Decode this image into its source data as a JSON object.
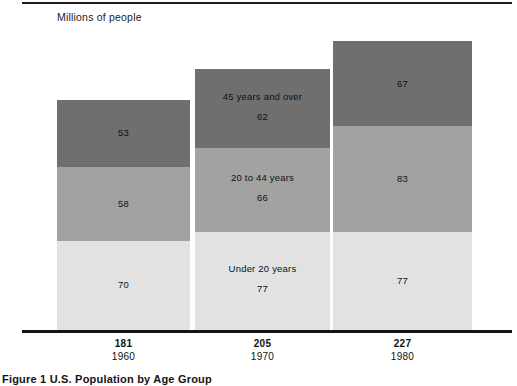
{
  "figure": {
    "units_label": "Millions of people",
    "caption": "Figure 1 U.S. Population by Age Group"
  },
  "chart_data": {
    "type": "bar",
    "subtype": "stacked-bar",
    "title": "",
    "subtitle": "",
    "xlabel": "",
    "ylabel": "Millions of people",
    "grid": false,
    "legend_position": "in-bar-labels",
    "categories": [
      "1960",
      "1970",
      "1980"
    ],
    "category_totals": [
      181,
      205,
      227
    ],
    "series": [
      {
        "name": "Under 20 years",
        "values": [
          70,
          77,
          77
        ],
        "color": "#e2e2e2"
      },
      {
        "name": "20 to 44 years",
        "values": [
          58,
          66,
          83
        ],
        "color": "#a2a2a2"
      },
      {
        "name": "45 years and over",
        "values": [
          53,
          62,
          67
        ],
        "color": "#6f6f6f"
      }
    ],
    "series_label_shown_on": "1970",
    "value_labels": {
      "1960": {
        "under_20": "70",
        "20_to_44": "58",
        "45_and_over": "53",
        "total": "181"
      },
      "1970": {
        "under_20": "77",
        "20_to_44": "66",
        "45_and_over": "62",
        "total": "205"
      },
      "1980": {
        "under_20": "77",
        "20_to_44": "83",
        "45_and_over": "67",
        "total": "227"
      }
    },
    "ylim": [
      0,
      227
    ],
    "colors": {
      "light": "#e2e2e2",
      "medium": "#a2a2a2",
      "dark": "#6f6f6f",
      "axis": "#141414",
      "text": "#111111"
    }
  },
  "bars": [
    {
      "year": "1960",
      "total": "181",
      "segments": [
        {
          "key": "45-and-over",
          "label": "",
          "value": "53",
          "shade": "dark"
        },
        {
          "key": "20-to-44",
          "label": "",
          "value": "58",
          "shade": "medium"
        },
        {
          "key": "under-20",
          "label": "",
          "value": "70",
          "shade": "light"
        }
      ]
    },
    {
      "year": "1970",
      "total": "205",
      "segments": [
        {
          "key": "45-and-over",
          "label": "45 years and over",
          "value": "62",
          "shade": "dark"
        },
        {
          "key": "20-to-44",
          "label": "20 to 44 years",
          "value": "66",
          "shade": "medium"
        },
        {
          "key": "under-20",
          "label": "Under 20 years",
          "value": "77",
          "shade": "light"
        }
      ]
    },
    {
      "year": "1980",
      "total": "227",
      "segments": [
        {
          "key": "45-and-over",
          "label": "",
          "value": "67",
          "shade": "dark"
        },
        {
          "key": "20-to-44",
          "label": "",
          "value": "83",
          "shade": "medium"
        },
        {
          "key": "under-20",
          "label": "",
          "value": "77",
          "shade": "light"
        }
      ]
    }
  ]
}
